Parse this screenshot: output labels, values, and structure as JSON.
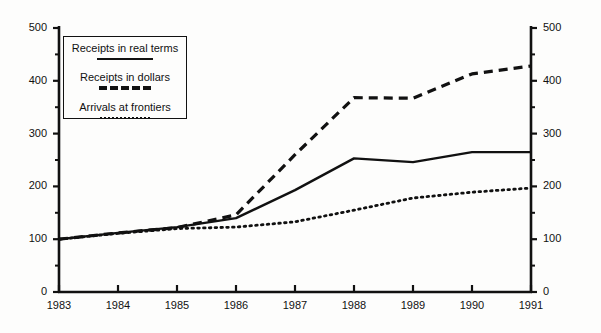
{
  "chart_data": {
    "type": "line",
    "title": "",
    "xlabel": "",
    "ylabel": "",
    "ylim": [
      0,
      500
    ],
    "grid": false,
    "legend_position": "top-left",
    "x": [
      "1983",
      "1984",
      "1985",
      "1986",
      "1987",
      "1988",
      "1989",
      "1990",
      "1991"
    ],
    "categories": [
      "1983",
      "1984",
      "1985",
      "1986",
      "1987",
      "1988",
      "1989",
      "1990",
      "1991"
    ],
    "yticks_left": [
      "0",
      "100",
      "200",
      "300",
      "400",
      "500"
    ],
    "yticks_right": [
      "0",
      "100",
      "200",
      "300",
      "400",
      "500"
    ],
    "yticks_minor": [
      50,
      150,
      250,
      350,
      450
    ],
    "series": [
      {
        "name": "Receipts in real terms",
        "style": "solid",
        "values": [
          100,
          112,
          123,
          140,
          193,
          253,
          246,
          265,
          265
        ]
      },
      {
        "name": "Receipts in dollars",
        "style": "dashed",
        "values": [
          100,
          112,
          122,
          146,
          260,
          368,
          367,
          413,
          428
        ]
      },
      {
        "name": "Arrivals at frontiers",
        "style": "dotted",
        "values": [
          100,
          111,
          120,
          123,
          133,
          155,
          178,
          189,
          197
        ]
      }
    ]
  },
  "legend": {
    "entries": [
      {
        "label": "Receipts in real terms",
        "style": "solid"
      },
      {
        "label": "Receipts in dollars",
        "style": "dashed"
      },
      {
        "label": "Arrivals at frontiers",
        "style": "dotted"
      }
    ]
  },
  "axes": {
    "left_ticks": [
      "500",
      "400",
      "300",
      "200",
      "100",
      "0"
    ],
    "right_ticks": [
      "500",
      "400",
      "300",
      "200",
      "100",
      "0"
    ],
    "x_ticks": [
      "1983",
      "1984",
      "1985",
      "1986",
      "1987",
      "1988",
      "1989",
      "1990",
      "1991"
    ]
  },
  "colors": {
    "ink": "#111111",
    "background": "#fdfdfc"
  }
}
